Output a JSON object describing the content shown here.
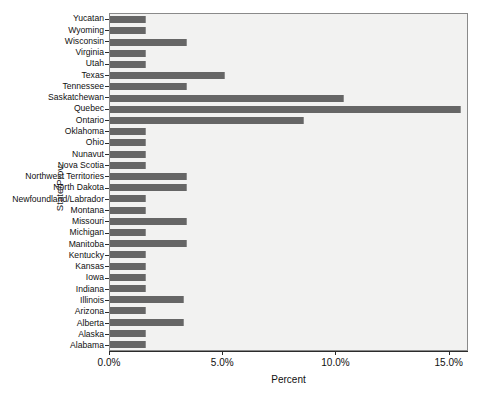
{
  "chart_data": {
    "type": "bar",
    "orientation": "horizontal",
    "title": "",
    "xlabel": "Percent",
    "ylabel": "State/Prov.",
    "xlim": [
      0,
      15.85
    ],
    "ylim": null,
    "grid": false,
    "legend": null,
    "xticks": [
      "0.0%",
      "5.0%",
      "10.0%",
      "15.0%"
    ],
    "xtick_values": [
      0,
      5,
      10,
      15
    ],
    "categories": [
      "Yucatan",
      "Wyoming",
      "Wisconsin",
      "Virginia",
      "Utah",
      "Texas",
      "Tennessee",
      "Saskatchewan",
      "Quebec",
      "Ontario",
      "Oklahoma",
      "Ohio",
      "Nunavut",
      "Nova Scotia",
      "Northwest Territories",
      "North Dakota",
      "Newfoundland/Labrador",
      "Montana",
      "Missouri",
      "Michigan",
      "Manitoba",
      "Kentucky",
      "Kansas",
      "Iowa",
      "Indiana",
      "Illinois",
      "Arizona",
      "Alberta",
      "Alaska",
      "Alabama"
    ],
    "values": [
      1.6,
      1.6,
      3.4,
      1.6,
      1.6,
      5.1,
      3.4,
      10.4,
      15.6,
      8.6,
      1.6,
      1.6,
      1.6,
      1.6,
      3.4,
      3.4,
      1.6,
      1.6,
      3.4,
      1.6,
      3.4,
      1.6,
      1.6,
      1.6,
      1.6,
      3.3,
      1.6,
      3.3,
      1.6,
      1.6
    ],
    "colors": {
      "bar": "#666666",
      "plot_background": "#f2f2f1",
      "plot_border": "#8a8a8a",
      "axis": "#2b2b2b",
      "text": "#101010",
      "page_background": "#ffffff"
    }
  }
}
